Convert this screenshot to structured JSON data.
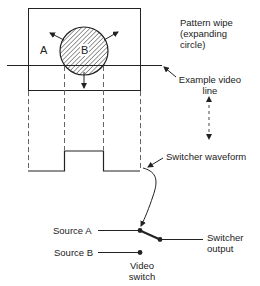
{
  "diagram": {
    "labels": {
      "pattern_wipe_line1": "Pattern wipe",
      "pattern_wipe_line2": "(expanding",
      "pattern_wipe_line3": "circle)",
      "example_line1": "Example video",
      "example_line2": "line",
      "switcher_waveform": "Switcher waveform",
      "source_a": "Source A",
      "source_b": "Source B",
      "video_switch_line1": "Video",
      "video_switch_line2": "switch",
      "switcher_output_line1": "Switcher",
      "switcher_output_line2": "output",
      "region_a": "A",
      "region_b": "B"
    },
    "colors": {
      "stroke": "#222222",
      "background": "#ffffff"
    }
  }
}
